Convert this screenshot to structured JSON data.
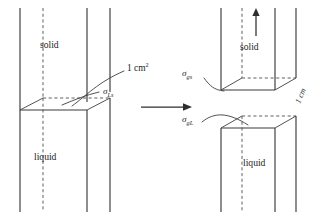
{
  "figure": {
    "background_color": "#ffffff",
    "line_color": "#3a3a3a",
    "dash_color": "#565656",
    "text_color": "#1d1d1d",
    "width": 317,
    "height": 218
  },
  "left_panel": {
    "name": "joined-column",
    "solid_label": "solid",
    "liquid_label": "liquid",
    "area_label": "1 cm",
    "area_label_superscript": "2",
    "interface_label_base": "σ",
    "interface_label_subscript": "Ls"
  },
  "transform_arrow": {
    "name": "separation-arrow",
    "direction": "right"
  },
  "right_panel": {
    "name": "separated-columns",
    "solid_label": "solid",
    "liquid_label": "liquid",
    "pull_arrow_direction": "up",
    "solid_gas_label_base": "σ",
    "solid_gas_label_subscript": "gs",
    "gas_liquid_label_base": "σ",
    "gas_liquid_label_subscript": "gL",
    "gap_label": "1 cm"
  }
}
